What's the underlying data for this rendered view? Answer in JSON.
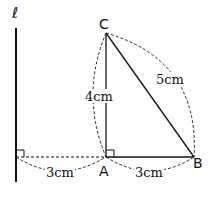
{
  "diagram": {
    "line_label": "ℓ",
    "points": {
      "C": "C",
      "A": "A",
      "B": "B"
    },
    "lengths": {
      "AC": "4cm",
      "BC": "5cm",
      "line_to_A": "3cm",
      "AB": "3cm"
    },
    "colors": {
      "stroke": "#111111",
      "background": "#ffffff"
    }
  }
}
